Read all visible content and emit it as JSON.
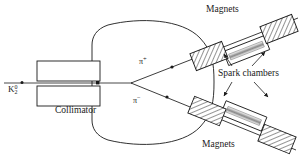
{
  "figure": {
    "type": "apparatus-schematic",
    "title_visible": false,
    "background_color": "#ffffff",
    "line_color": "#1a1a1a"
  },
  "labels": {
    "beam": {
      "particle": "K",
      "superscript": "0",
      "subscript": "2",
      "name": "neutral-kaon-beam"
    },
    "collimator": "Collimator",
    "pi_plus": {
      "symbol": "π",
      "charge": "+"
    },
    "pi_minus": {
      "symbol": "π",
      "charge": "−"
    },
    "magnets_top": "Magnets",
    "magnets_bottom": "Magnets",
    "spark_chambers": "Spark chambers"
  },
  "components": {
    "collimator": {
      "jaws": 2,
      "label": "Collimator",
      "hatched": false
    },
    "decay_volume": {
      "shape": "oval",
      "label": ""
    },
    "arms": [
      {
        "id": "upper",
        "particle": "π+",
        "magnets": 2,
        "spark_chambers": 2
      },
      {
        "id": "lower",
        "particle": "π−",
        "magnets": 2,
        "spark_chambers": 2
      }
    ],
    "arrow_count": 4
  },
  "colors": {
    "stroke": "#1a1a1a",
    "hatch": "#3a3a3a",
    "fill": "#ffffff",
    "shade": "#808080"
  }
}
